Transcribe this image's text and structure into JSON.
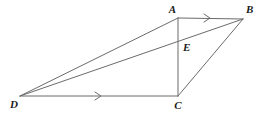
{
  "figure": {
    "background_color": "#ffffff",
    "line_color": "#6b6b6b",
    "label_color": "#1a1a1a",
    "labels": {
      "A": "A",
      "B": "B",
      "C": "C",
      "D": "D",
      "E": "E"
    },
    "points": {
      "A": {
        "x": 178,
        "y": 18
      },
      "B": {
        "x": 243,
        "y": 19
      },
      "C": {
        "x": 178,
        "y": 96
      },
      "D": {
        "x": 20,
        "y": 96
      },
      "E": {
        "x": 178,
        "y": 44
      }
    },
    "label_positions": {
      "A": {
        "x": 176,
        "y": 13,
        "anchor": "end"
      },
      "B": {
        "x": 246,
        "y": 13,
        "anchor": "start"
      },
      "C": {
        "x": 178,
        "y": 109,
        "anchor": "middle"
      },
      "D": {
        "x": 14,
        "y": 108,
        "anchor": "middle"
      },
      "E": {
        "x": 183,
        "y": 51,
        "anchor": "start"
      }
    },
    "segments": [
      {
        "name": "segment-AB",
        "from": "A",
        "to": "B",
        "tick_mark": "single-arrow"
      },
      {
        "name": "segment-DC",
        "from": "D",
        "to": "C",
        "tick_mark": "single-arrow"
      },
      {
        "name": "segment-AC",
        "from": "A",
        "to": "C",
        "tick_mark": "none"
      },
      {
        "name": "segment-DA",
        "from": "D",
        "to": "A",
        "tick_mark": "none"
      },
      {
        "name": "segment-DB",
        "from": "D",
        "to": "B",
        "tick_mark": "none"
      },
      {
        "name": "segment-CB",
        "from": "C",
        "to": "B",
        "tick_mark": "none"
      }
    ],
    "parallel_marks": [
      {
        "name": "parallel-mark-ab",
        "x": 208,
        "y": 18,
        "on": "segment-AB"
      },
      {
        "name": "parallel-mark-dc",
        "x": 99,
        "y": 96,
        "on": "segment-DC"
      }
    ],
    "notes": {
      "intersection": "E is the intersection of segment AC with segment DB",
      "parallel_pair": "AB is parallel to DC"
    }
  }
}
